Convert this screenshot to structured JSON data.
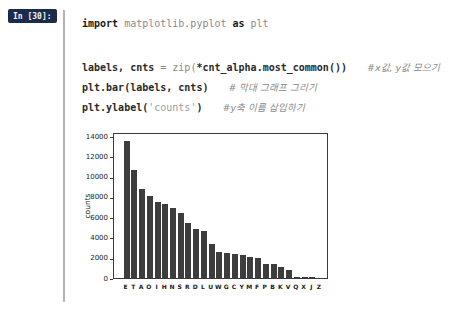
{
  "cell": {
    "prompt": "In [30]:",
    "code_lines": [
      {
        "segments": [
          {
            "text": "import",
            "style": "kw"
          },
          {
            "text": " matplotlib.pyplot ",
            "style": "plain"
          },
          {
            "text": "as",
            "style": "kw"
          },
          {
            "text": " plt",
            "style": "plain"
          }
        ],
        "comment": ""
      },
      {
        "segments": [
          {
            "text": "labels, cnts ",
            "style": "bold"
          },
          {
            "text": "= ",
            "style": "plain"
          },
          {
            "text": "zip(",
            "style": "plain"
          },
          {
            "text": "*cnt_alpha.most_common",
            "style": "bold"
          },
          {
            "text": "())",
            "style": "bold"
          }
        ],
        "comment": "#x값, y값 모으기"
      },
      {
        "segments": [
          {
            "text": "plt.bar(labels, cnts)",
            "style": "bold"
          }
        ],
        "comment": "# 막대 그래프 그리기"
      },
      {
        "segments": [
          {
            "text": "plt.ylabel(",
            "style": "bold"
          },
          {
            "text": "'counts'",
            "style": "str"
          },
          {
            "text": ")",
            "style": "bold"
          }
        ],
        "comment": "#y축 이름 삽입하기"
      }
    ]
  },
  "chart_data": {
    "type": "bar",
    "title": "",
    "xlabel": "",
    "ylabel": "counts",
    "categories": [
      "E",
      "T",
      "A",
      "O",
      "I",
      "H",
      "N",
      "S",
      "R",
      "D",
      "L",
      "U",
      "W",
      "G",
      "C",
      "Y",
      "M",
      "F",
      "P",
      "B",
      "K",
      "V",
      "Q",
      "X",
      "J",
      "Z"
    ],
    "values": [
      13500,
      10650,
      8750,
      8100,
      7500,
      7350,
      6950,
      6450,
      5400,
      4850,
      4650,
      3400,
      2600,
      2450,
      2350,
      2250,
      2100,
      2000,
      1400,
      1400,
      1100,
      800,
      130,
      110,
      100,
      50
    ],
    "yticks": [
      0,
      2000,
      4000,
      6000,
      8000,
      10000,
      12000,
      14000
    ],
    "ylim": [
      0,
      14400
    ],
    "bar_color": "#3d3d3d",
    "grid": false,
    "legend": "none"
  }
}
